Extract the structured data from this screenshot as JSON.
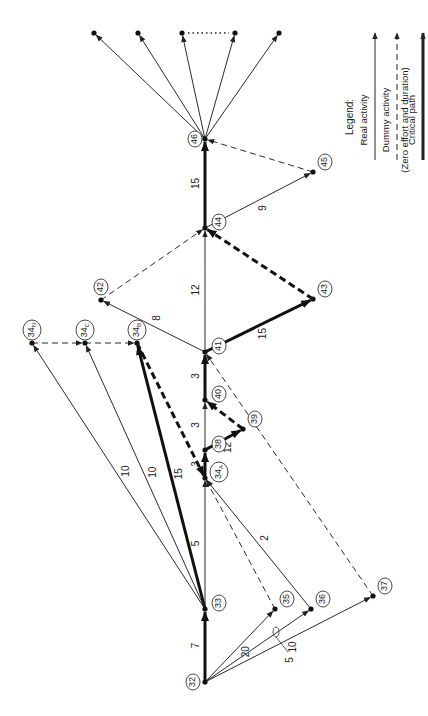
{
  "diagram": {
    "type": "activity-on-arrow network",
    "orientation": "rotated 90deg counter-clockwise",
    "colors": {
      "line": "#2a2a2a",
      "critical": "#111111",
      "background": "#ffffff"
    },
    "nodes": [
      {
        "id": "32",
        "x": 205,
        "y": 682
      },
      {
        "id": "33",
        "x": 205,
        "y": 609
      },
      {
        "id": "34A",
        "label": "34",
        "sub": "A",
        "x": 205,
        "y": 478
      },
      {
        "id": "34B",
        "label": "34",
        "sub": "B",
        "x": 137,
        "y": 343
      },
      {
        "id": "34C",
        "label": "34",
        "sub": "C",
        "x": 85,
        "y": 343
      },
      {
        "id": "34N",
        "label": "34",
        "sub": "N",
        "x": 32,
        "y": 343
      },
      {
        "id": "35",
        "x": 275,
        "y": 609
      },
      {
        "id": "36",
        "x": 311,
        "y": 609
      },
      {
        "id": "37",
        "x": 373,
        "y": 596
      },
      {
        "id": "38",
        "x": 205,
        "y": 450
      },
      {
        "id": "39",
        "x": 243,
        "y": 429
      },
      {
        "id": "40",
        "x": 205,
        "y": 400
      },
      {
        "id": "41",
        "x": 205,
        "y": 352
      },
      {
        "id": "42",
        "x": 101,
        "y": 300
      },
      {
        "id": "43",
        "x": 313,
        "y": 299
      },
      {
        "id": "44",
        "x": 205,
        "y": 228
      },
      {
        "id": "45",
        "x": 313,
        "y": 172
      },
      {
        "id": "46",
        "x": 205,
        "y": 139
      },
      {
        "id": "e1",
        "x": 94,
        "y": 33,
        "unlabeled": true
      },
      {
        "id": "e2",
        "x": 138,
        "y": 33,
        "unlabeled": true
      },
      {
        "id": "e3",
        "x": 182,
        "y": 33,
        "unlabeled": true
      },
      {
        "id": "e4",
        "x": 235,
        "y": 33,
        "unlabeled": true
      },
      {
        "id": "e5",
        "x": 279,
        "y": 33,
        "unlabeled": true
      }
    ],
    "activities": [
      {
        "from": "32",
        "to": "33",
        "duration": "7",
        "type": "critical"
      },
      {
        "from": "32",
        "to": "35",
        "duration": "20",
        "type": "real"
      },
      {
        "from": "32",
        "to": "36",
        "duration": "5",
        "type": "real"
      },
      {
        "from": "32",
        "to": "37",
        "duration": "10",
        "type": "real"
      },
      {
        "from": "33",
        "to": "34A",
        "duration": "5",
        "type": "real"
      },
      {
        "from": "33",
        "to": "34B",
        "duration": "15",
        "type": "critical"
      },
      {
        "from": "33",
        "to": "34C",
        "duration": "10",
        "type": "real"
      },
      {
        "from": "33",
        "to": "34N",
        "duration": "10",
        "type": "real"
      },
      {
        "from": "34N",
        "to": "34C",
        "duration": "",
        "type": "dummy"
      },
      {
        "from": "34C",
        "to": "34B",
        "duration": "",
        "type": "dummy"
      },
      {
        "from": "34B",
        "to": "34A",
        "duration": "",
        "type": "dummy-critical"
      },
      {
        "from": "35",
        "to": "34A",
        "duration": "",
        "type": "dummy"
      },
      {
        "from": "36",
        "to": "34A",
        "duration": "2",
        "type": "real"
      },
      {
        "from": "34A",
        "to": "38",
        "duration": "3",
        "type": "critical"
      },
      {
        "from": "38",
        "to": "39",
        "duration": "12",
        "type": "critical"
      },
      {
        "from": "38",
        "to": "40",
        "duration": "3",
        "type": "real"
      },
      {
        "from": "39",
        "to": "40",
        "duration": "",
        "type": "dummy-critical"
      },
      {
        "from": "40",
        "to": "41",
        "duration": "3",
        "type": "critical"
      },
      {
        "from": "37",
        "to": "41",
        "duration": "",
        "type": "dummy"
      },
      {
        "from": "41",
        "to": "42",
        "duration": "8",
        "type": "real"
      },
      {
        "from": "41",
        "to": "43",
        "duration": "15",
        "type": "critical"
      },
      {
        "from": "41",
        "to": "44",
        "duration": "12",
        "type": "real"
      },
      {
        "from": "42",
        "to": "44",
        "duration": "",
        "type": "dummy"
      },
      {
        "from": "43",
        "to": "44",
        "duration": "",
        "type": "dummy-critical"
      },
      {
        "from": "44",
        "to": "46",
        "duration": "15",
        "type": "critical"
      },
      {
        "from": "44",
        "to": "45",
        "duration": "9",
        "type": "real"
      },
      {
        "from": "45",
        "to": "46",
        "duration": "",
        "type": "dummy"
      },
      {
        "from": "46",
        "to": "e1",
        "duration": "",
        "type": "real"
      },
      {
        "from": "46",
        "to": "e2",
        "duration": "",
        "type": "real"
      },
      {
        "from": "46",
        "to": "e3",
        "duration": "",
        "type": "real"
      },
      {
        "from": "46",
        "to": "e4",
        "duration": "",
        "type": "real"
      },
      {
        "from": "46",
        "to": "e5",
        "duration": "",
        "type": "real"
      }
    ],
    "ellipsis": {
      "from": "e3",
      "to": "e4",
      "style": "dotted"
    }
  },
  "legend": {
    "title": "Legend:",
    "items": [
      {
        "label": "Real activity",
        "style": "solid-thin"
      },
      {
        "label": "Dummy activity",
        "sublabel": "(Zero effort and duration)",
        "style": "dashed"
      },
      {
        "label": "Critical path",
        "style": "solid-thick"
      }
    ]
  }
}
